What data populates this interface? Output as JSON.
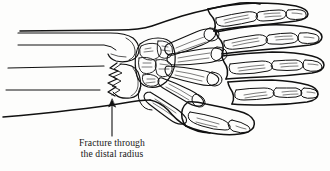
{
  "figure": {
    "title": "Fracture through the distal radius",
    "background_color": "#fdfdfc",
    "ink_color": "#111111",
    "caption": {
      "line1": "Fracture through",
      "line2": "the distal radius"
    },
    "annotation": {
      "arrow_label": "fracture-pointer",
      "arrow_direction": "up",
      "points_to": "distal radius fracture line"
    },
    "structures": [
      {
        "name": "ulna",
        "label": "ulna"
      },
      {
        "name": "radius",
        "label": "radius"
      },
      {
        "name": "fracture-line",
        "label": "fracture line"
      },
      {
        "name": "carpal-bones",
        "label": "carpal bones"
      },
      {
        "name": "metacarpals",
        "label": "metacarpals"
      },
      {
        "name": "proximal-phalanges",
        "label": "proximal phalanges"
      },
      {
        "name": "middle-phalanges",
        "label": "middle phalanges"
      },
      {
        "name": "distal-phalanges",
        "label": "distal phalanges"
      },
      {
        "name": "thumb",
        "label": "thumb"
      },
      {
        "name": "skin-outline",
        "label": "soft tissue outline"
      }
    ]
  }
}
